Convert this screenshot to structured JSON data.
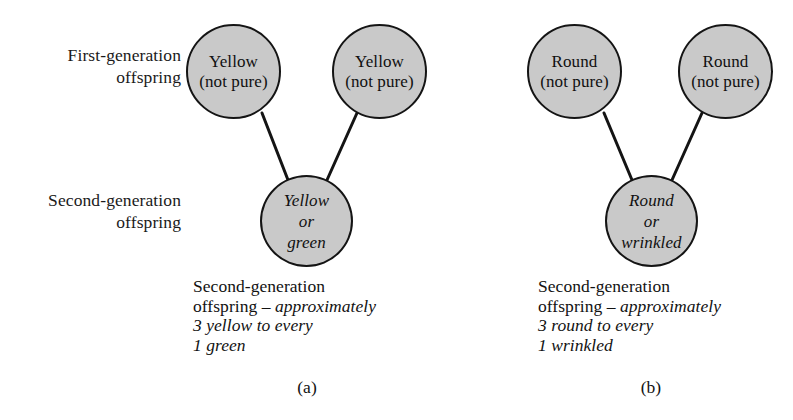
{
  "figure": {
    "type": "inheritance-pedigree-diagram",
    "panel_count": 2,
    "colors": {
      "node_fill": "#c9c9c9",
      "node_stroke": "#141414",
      "connector_stroke": "#141414",
      "text": "#121212",
      "background": "#ffffff"
    }
  },
  "row_labels": {
    "first_generation": "First-generation\noffspring",
    "second_generation": "Second-generation\noffspring"
  },
  "panels": [
    {
      "id": "a",
      "letter": "(a)",
      "trait": "seed colour",
      "parents": [
        {
          "id": "a-parent-left",
          "text": "Yellow\n(not pure)",
          "style": "roman"
        },
        {
          "id": "a-parent-right",
          "text": "Yellow\n(not pure)",
          "style": "roman"
        }
      ],
      "offspring": {
        "id": "a-offspring",
        "text": "Yellow\nor\ngreen",
        "style": "italic"
      },
      "caption": {
        "line1": "Second-generation",
        "line2_roman": "offspring – ",
        "line2_italic": "approximately",
        "line3_italic": "3 yellow to every",
        "line4_italic": "1 green"
      }
    },
    {
      "id": "b",
      "letter": "(b)",
      "trait": "seed shape",
      "parents": [
        {
          "id": "b-parent-left",
          "text": "Round\n(not pure)",
          "style": "roman"
        },
        {
          "id": "b-parent-right",
          "text": "Round\n(not pure)",
          "style": "roman"
        }
      ],
      "offspring": {
        "id": "b-offspring",
        "text": "Round\nor\nwrinkled",
        "style": "italic"
      },
      "caption": {
        "line1": "Second-generation",
        "line2_roman": "offspring – ",
        "line2_italic": "approximately",
        "line3_italic": "3 round to every",
        "line4_italic": "1 wrinkled"
      }
    }
  ]
}
